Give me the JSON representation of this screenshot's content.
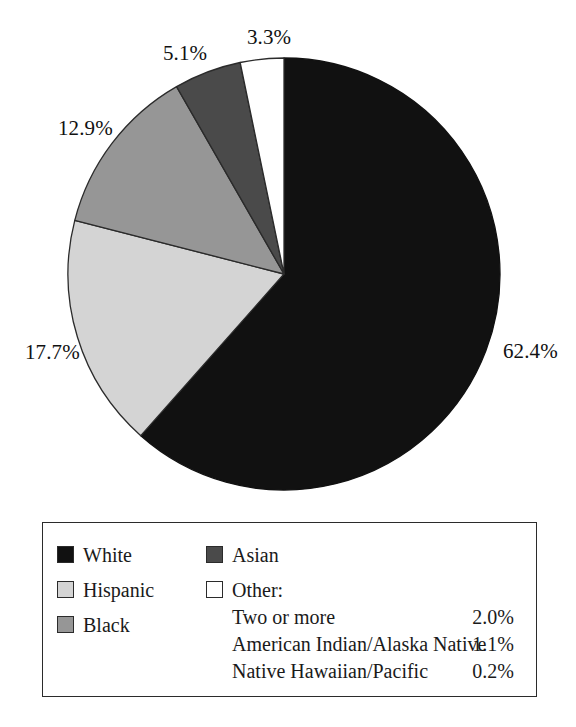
{
  "chart_data": {
    "type": "pie",
    "title": "",
    "subtitle": "",
    "xlabel": "",
    "ylabel": "",
    "legend_position": "bottom",
    "grid": false,
    "start_angle_deg": 90,
    "direction": "clockwise",
    "categories": [
      "White",
      "Hispanic",
      "Black",
      "Asian",
      "Other"
    ],
    "values": [
      62.4,
      17.7,
      12.9,
      5.1,
      3.3
    ],
    "colors": [
      "#111111",
      "#d4d4d4",
      "#969696",
      "#4a4a4a",
      "#ffffff"
    ],
    "data_labels": [
      "62.4%",
      "17.7%",
      "12.9%",
      "5.1%",
      "3.3%"
    ],
    "breakdown": {
      "parent": "Other",
      "categories": [
        "Two or more",
        "American Indian/Alaska Native",
        "Native Hawaiian/Pacific"
      ],
      "values": [
        2.0,
        1.1,
        0.2
      ],
      "labels": [
        "2.0%",
        "1.1%",
        "0.2%"
      ]
    }
  },
  "pie": {
    "slices": [
      {
        "name": "White",
        "label": "62.4%",
        "value": 62.4,
        "color": "#111111",
        "stroke": "#111111"
      },
      {
        "name": "Hispanic",
        "label": "17.7%",
        "value": 17.7,
        "color": "#d4d4d4",
        "stroke": "#2b2b2b"
      },
      {
        "name": "Black",
        "label": "12.9%",
        "value": 12.9,
        "color": "#969696",
        "stroke": "#2b2b2b"
      },
      {
        "name": "Asian",
        "label": "5.1%",
        "value": 5.1,
        "color": "#4a4a4a",
        "stroke": "#2b2b2b"
      },
      {
        "name": "Other",
        "label": "3.3%",
        "value": 3.3,
        "color": "#ffffff",
        "stroke": "#2b2b2b"
      }
    ],
    "labels": {
      "white": "62.4%",
      "hispanic": "17.7%",
      "black": "12.9%",
      "asian": "5.1%",
      "other": "3.3%"
    }
  },
  "legend": {
    "left_column": [
      {
        "label": "White",
        "swatch_color": "#111111"
      },
      {
        "label": "Hispanic",
        "swatch_color": "#d4d4d4"
      },
      {
        "label": "Black",
        "swatch_color": "#969696"
      }
    ],
    "right_column": [
      {
        "label": "Asian",
        "swatch_color": "#4a4a4a"
      },
      {
        "label": "Other:",
        "swatch_color": "#ffffff"
      }
    ],
    "other_breakdown": [
      {
        "label": "Two or more",
        "value": "2.0%"
      },
      {
        "label": "American Indian/Alaska Native",
        "value": "1.1%"
      },
      {
        "label": "Native Hawaiian/Pacific",
        "value": "0.2%"
      }
    ]
  }
}
